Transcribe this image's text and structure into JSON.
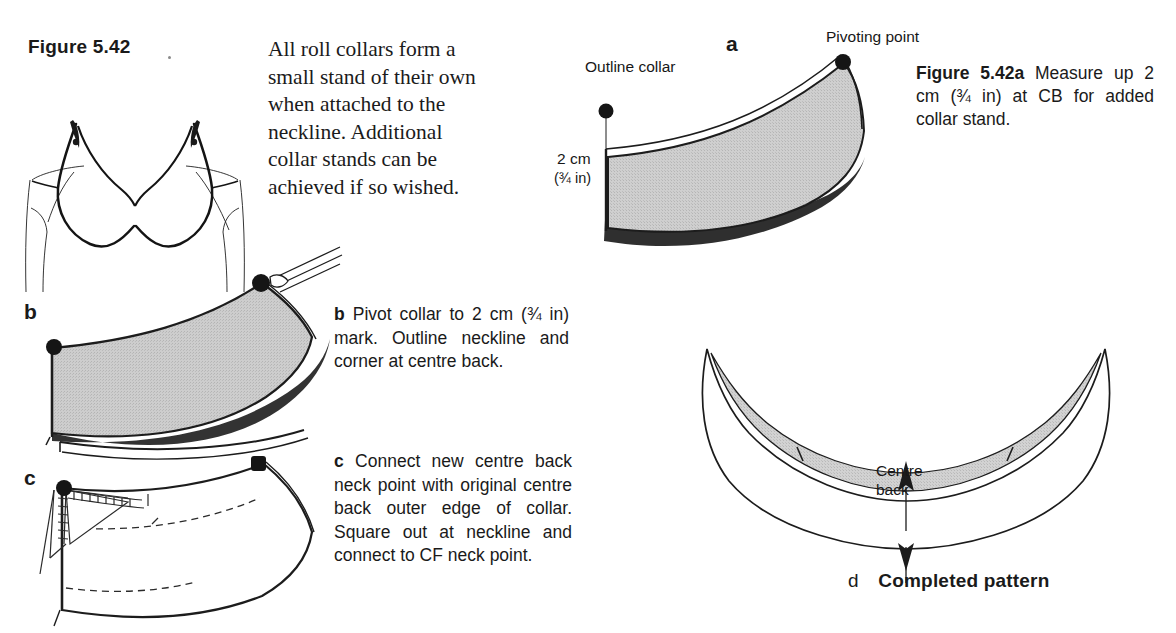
{
  "figure": {
    "title": "Figure 5.42",
    "intro_paragraph": "All roll collars form a small stand of their own when attached to the neckline. Additional collar stands can be achieved if so wished."
  },
  "caption_a": {
    "figure_ref": "Figure 5.42a",
    "text": " Measure up 2 cm (¾ in) at CB for added collar stand."
  },
  "panels": {
    "a": {
      "letter": "a",
      "label_outline_collar": "Outline collar",
      "label_pivoting_point": "Pivoting point",
      "label_measure_cm": "2 cm",
      "label_measure_in": "(¾ in)",
      "label_centre_back": "Centre back"
    },
    "b": {
      "letter": "b",
      "step_label": "b",
      "step_text": " Pivot collar to 2 cm (¾ in) mark. Outline neckline and corner at centre back."
    },
    "c": {
      "letter": "c",
      "step_label": "c",
      "step_text": " Connect new centre back neck point with original centre back outer edge of collar. Square out at neckline and connect to CF neck point."
    },
    "d": {
      "letter": "d",
      "title": "Completed pattern",
      "label_centre_line1": "Centre",
      "label_centre_line2": "back"
    }
  },
  "colors": {
    "paper": "#ffffff",
    "ink": "#1a1a1a",
    "pattern_fill": "#c9c9c9",
    "pattern_fill_light": "#d6d6d6",
    "outline": "#1c1c1c"
  }
}
